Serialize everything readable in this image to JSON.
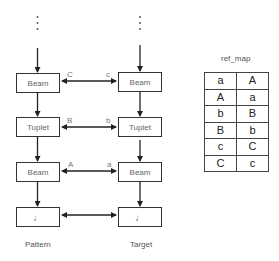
{
  "pattern": {
    "label": "Pattern",
    "nodes": [
      {
        "label": "Beam"
      },
      {
        "label": "Tuplet"
      },
      {
        "label": "Beam"
      },
      {
        "label": "♩"
      }
    ]
  },
  "target": {
    "label": "Target",
    "nodes": [
      {
        "label": "Beam"
      },
      {
        "label": "Tuplet"
      },
      {
        "label": "Beam"
      },
      {
        "label": "♩"
      }
    ]
  },
  "links": [
    {
      "left": "C",
      "right": "c"
    },
    {
      "left": "B",
      "right": "b"
    },
    {
      "left": "A",
      "right": "a"
    },
    {
      "left": "",
      "right": ""
    }
  ],
  "ref_map": {
    "title": "ref_map",
    "rows": [
      [
        "a",
        "A"
      ],
      [
        "A",
        "a"
      ],
      [
        "b",
        "B"
      ],
      [
        "B",
        "b"
      ],
      [
        "c",
        "C"
      ],
      [
        "C",
        "c"
      ]
    ]
  },
  "colors": {
    "line": "#222222",
    "box_border": "#333333",
    "text": "#666666"
  }
}
